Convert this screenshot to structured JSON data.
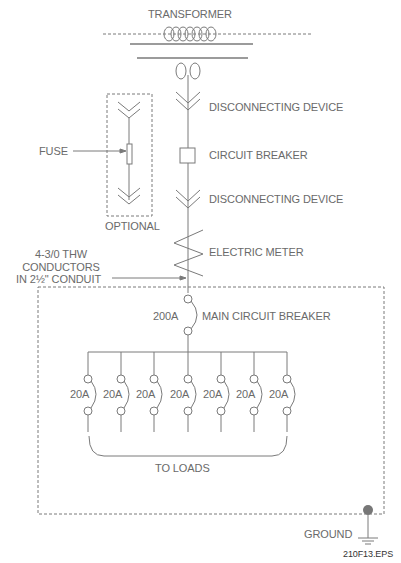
{
  "diagram": {
    "title": "TRANSFORMER",
    "labels": {
      "disconnect_top": "DISCONNECTING DEVICE",
      "circuit_breaker": "CIRCUIT BREAKER",
      "disconnect_bottom": "DISCONNECTING DEVICE",
      "electric_meter": "ELECTRIC METER",
      "fuse": "FUSE",
      "optional": "OPTIONAL",
      "conductors_line1": "4-3/0 THW",
      "conductors_line2": "CONDUCTORS",
      "conductors_line3": "IN 2½\" CONDUIT",
      "main_breaker_rating": "200A",
      "main_breaker": "MAIN CIRCUIT BREAKER",
      "to_loads": "TO LOADS",
      "ground": "GROUND",
      "figure_id": "210F13.EPS"
    },
    "branch_breakers": [
      "20A",
      "20A",
      "20A",
      "20A",
      "20A",
      "20A",
      "20A"
    ],
    "line_color": "#7a7a7a",
    "text_color": "#6a6a6a",
    "ground_dot_color": "#777777"
  }
}
